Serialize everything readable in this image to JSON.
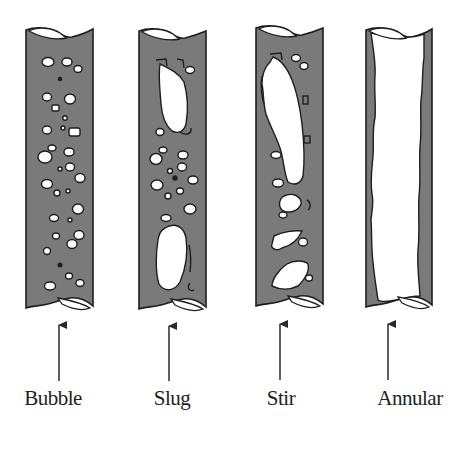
{
  "figure": {
    "colors": {
      "liquid": "#7a7a7a",
      "gas": "#ffffff",
      "outline": "#1e1e1e",
      "arrow": "#2a2a2a"
    },
    "flow_direction": "upward",
    "regimes": [
      {
        "id": "bubble",
        "label": "Bubble",
        "center_x": 59
      },
      {
        "id": "slug",
        "label": "Slug",
        "center_x": 172
      },
      {
        "id": "stir",
        "label": "Stir",
        "center_x": 281
      },
      {
        "id": "annular",
        "label": "Annular",
        "center_x": 391
      }
    ]
  }
}
